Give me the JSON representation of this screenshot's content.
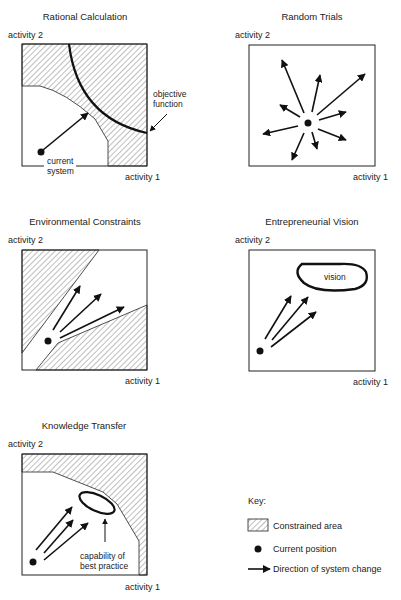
{
  "panels": [
    {
      "id": "rational-calculation",
      "title": "Rational Calculation",
      "y_axis_label": "activity 2",
      "x_axis_label": "activity 1",
      "annotations": [
        "objective function",
        "current",
        "system"
      ]
    },
    {
      "id": "random-trials",
      "title": "Random Trials",
      "y_axis_label": "activity 2",
      "x_axis_label": "activity 1",
      "annotations": []
    },
    {
      "id": "environmental-constraints",
      "title": "Environmental Constraints",
      "y_axis_label": "activity 2",
      "x_axis_label": "activity 1",
      "annotations": []
    },
    {
      "id": "entrepreneurial-vision",
      "title": "Entrepreneurial Vision",
      "y_axis_label": "activity 2",
      "x_axis_label": "activity 1",
      "annotations": [
        "vision"
      ]
    },
    {
      "id": "knowledge-transfer",
      "title": "Knowledge Transfer",
      "y_axis_label": "activity 2",
      "x_axis_label": "activity 1",
      "annotations": [
        "capability of",
        "best practice"
      ]
    }
  ],
  "legend": {
    "title": "Key:",
    "items": [
      {
        "symbol": "hatched-box",
        "label": "Constrained area"
      },
      {
        "symbol": "filled-dot",
        "label": "Current position"
      },
      {
        "symbol": "arrow",
        "label": "Direction of system change"
      }
    ]
  },
  "colors": {
    "ink": "#111111",
    "background": "#ffffff"
  }
}
